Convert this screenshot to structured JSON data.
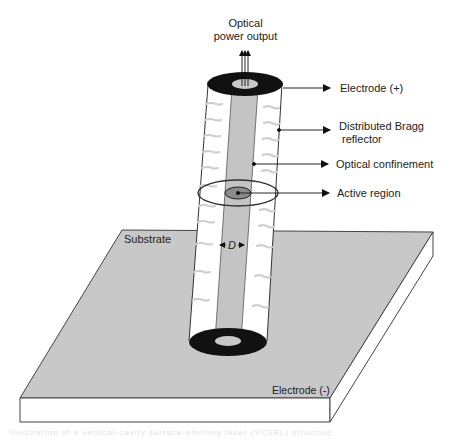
{
  "diagram": {
    "labels": {
      "optical_output_line1": "Optical",
      "optical_output_line2": "power output",
      "electrode_plus": "Electrode (+)",
      "dbr_line1": "Distributed Bragg",
      "dbr_line2": "reflector",
      "optical_confinement": "Optical confinement",
      "active_region": "Active region",
      "substrate": "Substrate",
      "diameter": "D",
      "electrode_minus": "Electrode (-)"
    },
    "caption": "Illustration of a vertical-cavity surface-emitting laser (VCSEL) structure"
  },
  "colors": {
    "substrate_fill": "#c8c8c8",
    "core_fill": "#c4c4c4",
    "electrode_fill": "#111111",
    "line": "#333333",
    "dbr_marks": "#cfcfcf"
  }
}
